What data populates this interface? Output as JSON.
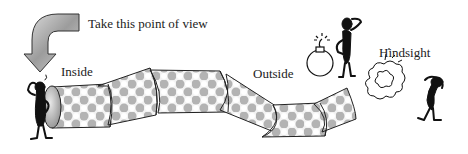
{
  "labels": {
    "pov": "Take this point of view",
    "inside": "Inside",
    "outside": "Outside",
    "hindsight": "Hindsight"
  },
  "figure": {
    "elements": [
      {
        "name": "curved-arrow",
        "description": "grey curved arrow pointing down toward tube start"
      },
      {
        "name": "tube",
        "segments": 7,
        "description": "bending checkered tube"
      },
      {
        "name": "figure-inside",
        "description": "stick figure scratching head at tube entrance"
      },
      {
        "name": "bomb",
        "description": "bomb with lit fuse"
      },
      {
        "name": "figure-outside",
        "description": "stick figure scratching head next to bomb"
      },
      {
        "name": "explosion",
        "description": "explosion cloud"
      },
      {
        "name": "figure-hindsight",
        "description": "stick figure bent over holding head"
      }
    ]
  },
  "colors": {
    "stroke": "#222222",
    "tube_light": "#f2f2f2",
    "tube_dark": "#9a9a9a",
    "arrow": "#b8b8b8"
  }
}
